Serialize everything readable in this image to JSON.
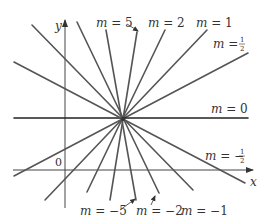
{
  "figure": {
    "axes": {
      "x_label": "x",
      "y_label": "y",
      "origin_label": "0",
      "x_axis_y": 170,
      "y_axis_x": 65
    },
    "center": {
      "x": 123,
      "y": 119
    },
    "line_color": "#555555",
    "axis_color": "#444444",
    "lines": [
      {
        "slope": "5",
        "label": "m = 5",
        "x1": 110,
        "y1": 200,
        "x2": 137,
        "y2": 32
      },
      {
        "slope": "2",
        "label": "m = 2",
        "x1": 87,
        "y1": 192,
        "x2": 165,
        "y2": 30
      },
      {
        "slope": "1",
        "label": "m = 1",
        "x1": 45,
        "y1": 200,
        "x2": 207,
        "y2": 30
      },
      {
        "slope": "1/2",
        "label": "m = 1/2",
        "x1": 14,
        "y1": 176,
        "x2": 248,
        "y2": 53
      },
      {
        "slope": "0",
        "label": "m = 0",
        "x1": 14,
        "y1": 118,
        "x2": 248,
        "y2": 118
      },
      {
        "slope": "-1/2",
        "label": "m = -1/2",
        "x1": 14,
        "y1": 62,
        "x2": 245,
        "y2": 183
      },
      {
        "slope": "-1",
        "label": "m = -1",
        "x1": 32,
        "y1": 25,
        "x2": 193,
        "y2": 190
      },
      {
        "slope": "-2",
        "label": "m = -2",
        "x1": 77,
        "y1": 22,
        "x2": 159,
        "y2": 193
      },
      {
        "slope": "-5",
        "label": "m = -5",
        "x1": 106,
        "y1": 30,
        "x2": 136,
        "y2": 200
      }
    ],
    "labels": {
      "m5": {
        "m": "m",
        "eq": " = 5"
      },
      "m2": {
        "m": "m",
        "eq": " = 2"
      },
      "m1": {
        "m": "m",
        "eq": " = 1"
      },
      "mhalf": {
        "m": "m",
        "eq": " = ",
        "num": "1",
        "den": "2"
      },
      "m0": {
        "m": "m",
        "eq": " = 0"
      },
      "mneghalf": {
        "m": "m",
        "eq": " = −",
        "num": "1",
        "den": "2"
      },
      "mneg5": {
        "m": "m",
        "eq": " = −5"
      },
      "mneg2": {
        "m": "m",
        "eq": " = −2"
      },
      "mneg1": {
        "m": "m",
        "eq": " = −1"
      }
    }
  }
}
